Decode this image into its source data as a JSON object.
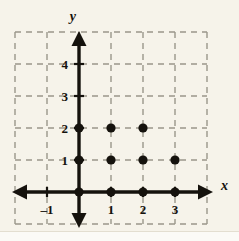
{
  "figure": {
    "name": "coordinate-grid-with-plotted-points",
    "background_color": "#f6f3ea",
    "ink_color": "#15120d",
    "grid_color": "#9a968a"
  },
  "axes": {
    "x_label": "x",
    "y_label": "y",
    "x_tick_labels": [
      "–1",
      "1",
      "2",
      "3"
    ],
    "y_tick_labels": [
      "1",
      "2",
      "3",
      "4"
    ]
  },
  "bleed_through": {
    "line1": "   ",
    "line2": "  ",
    "line3": "   ",
    "line4": "  ",
    "line5": "   "
  },
  "chart_data": {
    "type": "scatter",
    "title": "",
    "xlabel": "x",
    "ylabel": "y",
    "grid": true,
    "legend": null,
    "xlim": [
      -2,
      4
    ],
    "ylim": [
      -1,
      5
    ],
    "xticks": [
      -1,
      1,
      2,
      3
    ],
    "yticks": [
      1,
      2,
      3,
      4
    ],
    "xtick_labels": [
      "–1",
      "1",
      "2",
      "3"
    ],
    "ytick_labels": [
      "1",
      "2",
      "3",
      "4"
    ],
    "grid_step": 1,
    "point_style": "filled-circle",
    "point_color": "#15120d",
    "points": [
      {
        "x": 0,
        "y": 0
      },
      {
        "x": 1,
        "y": 0
      },
      {
        "x": 2,
        "y": 0
      },
      {
        "x": 3,
        "y": 0
      },
      {
        "x": 0,
        "y": 1
      },
      {
        "x": 1,
        "y": 1
      },
      {
        "x": 2,
        "y": 1
      },
      {
        "x": 3,
        "y": 1
      },
      {
        "x": 0,
        "y": 2
      },
      {
        "x": 1,
        "y": 2
      },
      {
        "x": 2,
        "y": 2
      }
    ]
  }
}
